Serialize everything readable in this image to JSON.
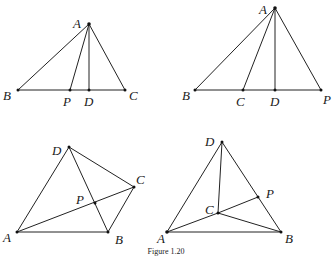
{
  "caption": "Figure 1.20",
  "figures": [
    {
      "id": "fig-top-left",
      "points": {
        "A": "A",
        "B": "B",
        "C": "C",
        "P": "P",
        "D": "D"
      }
    },
    {
      "id": "fig-top-right",
      "points": {
        "A": "A",
        "B": "B",
        "C": "C",
        "D": "D",
        "P": "P"
      }
    },
    {
      "id": "fig-bottom-left",
      "points": {
        "A": "A",
        "B": "B",
        "C": "C",
        "D": "D",
        "P": "P"
      }
    },
    {
      "id": "fig-bottom-right",
      "points": {
        "A": "A",
        "B": "B",
        "C": "C",
        "D": "D",
        "P": "P"
      }
    }
  ]
}
